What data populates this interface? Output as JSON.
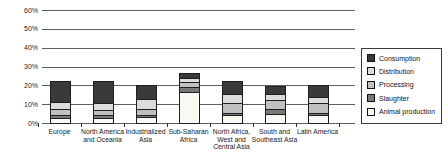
{
  "chart_data": {
    "type": "bar",
    "stacked": true,
    "title": "",
    "xlabel": "",
    "ylabel": "",
    "ylim": [
      0,
      60
    ],
    "grid": true,
    "legend_position": "right",
    "ytick_labels": [
      "0%",
      "10%",
      "20%",
      "30%",
      "40%",
      "50%",
      "60%"
    ],
    "yticks": [
      0,
      10,
      20,
      30,
      40,
      50,
      60
    ],
    "categories": [
      "Europe",
      "North America and Oceania",
      "Industrialized Asia",
      "Sub-Saharan Africa",
      "North Africa, West and Central Asia",
      "South and Southeast Asia",
      "Latin America"
    ],
    "series": [
      {
        "name": "Animal production",
        "color": "#faf9f4",
        "values": [
          2.5,
          2.5,
          3.0,
          16.5,
          4.0,
          5.0,
          4.0
        ]
      },
      {
        "name": "Slaughter",
        "color": "#787878",
        "values": [
          2.0,
          1.5,
          1.5,
          2.5,
          1.5,
          2.5,
          1.5
        ]
      },
      {
        "name": "Processing",
        "color": "#c0c0c0",
        "values": [
          3.0,
          3.0,
          3.0,
          2.5,
          5.0,
          4.5,
          5.0
        ]
      },
      {
        "name": "Distribution",
        "color": "#dcdcdc",
        "values": [
          3.5,
          3.5,
          5.0,
          2.5,
          5.0,
          3.5,
          3.5
        ]
      },
      {
        "name": "Consumption",
        "color": "#3a3a3a",
        "values": [
          11.0,
          11.5,
          7.0,
          2.0,
          6.5,
          3.5,
          5.5
        ]
      }
    ],
    "totals": [
      22.0,
      22.0,
      19.5,
      26.0,
      22.0,
      19.0,
      19.5
    ],
    "legend_order": [
      "Consumption",
      "Distribution",
      "Processing",
      "Slaughter",
      "Animal production"
    ],
    "colors": {
      "grid": "#5f5f5f",
      "bar_border": "#1f1f1f",
      "text": "#262626",
      "background": "#ffffff"
    }
  }
}
